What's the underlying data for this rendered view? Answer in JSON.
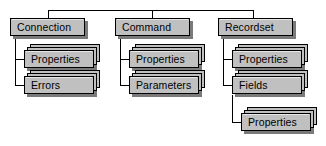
{
  "diagram": {
    "type": "hierarchy-tree",
    "colors": {
      "node_fill": "#c0c0c0",
      "node_border": "#000000",
      "node_shadow": "#7a7a7a",
      "background": "#ffffff",
      "connector": "#000000"
    },
    "roots": [
      {
        "id": "connection",
        "label": "Connection",
        "kind": "object",
        "children": [
          {
            "id": "connection-properties",
            "label": "Properties",
            "kind": "collection",
            "children": []
          },
          {
            "id": "connection-errors",
            "label": "Errors",
            "kind": "collection",
            "children": []
          }
        ]
      },
      {
        "id": "command",
        "label": "Command",
        "kind": "object",
        "children": [
          {
            "id": "command-properties",
            "label": "Properties",
            "kind": "collection",
            "children": []
          },
          {
            "id": "command-parameters",
            "label": "Parameters",
            "kind": "collection",
            "children": []
          }
        ]
      },
      {
        "id": "recordset",
        "label": "Recordset",
        "kind": "object",
        "children": [
          {
            "id": "recordset-properties",
            "label": "Properties",
            "kind": "collection",
            "children": []
          },
          {
            "id": "recordset-fields",
            "label": "Fields",
            "kind": "collection",
            "children": [
              {
                "id": "fields-properties",
                "label": "Properties",
                "kind": "collection",
                "children": []
              }
            ]
          }
        ]
      }
    ]
  }
}
